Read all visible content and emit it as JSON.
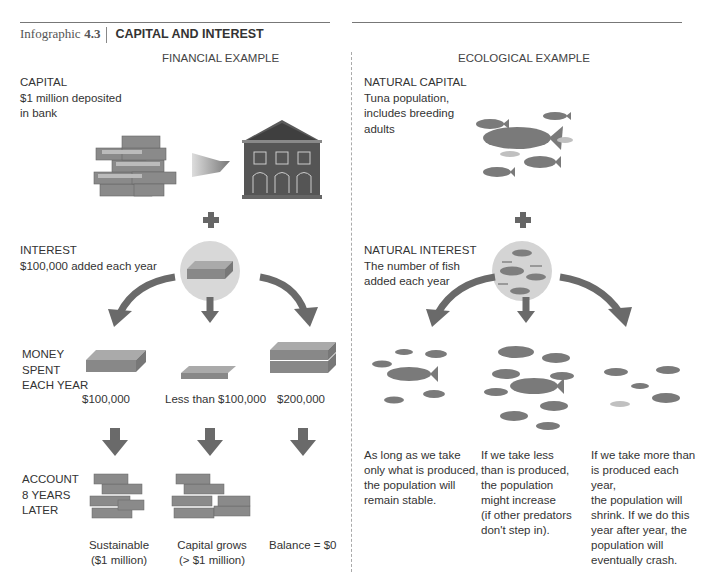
{
  "header": {
    "prefix": "Infographic",
    "number": "4.3",
    "title": "CAPITAL AND INTEREST"
  },
  "financial": {
    "section_title": "FINANCIAL EXAMPLE",
    "capital": {
      "heading": "CAPITAL",
      "line1": "$1 million deposited",
      "line2": "in bank"
    },
    "interest": {
      "heading": "INTEREST",
      "line1": "$100,000 added each year"
    },
    "spent_label": {
      "line1": "MONEY",
      "line2": "SPENT",
      "line3": "EACH YEAR"
    },
    "spent_values": [
      "$100,000",
      "Less than $100,000",
      "$200,000"
    ],
    "account_label": {
      "line1": "ACCOUNT",
      "line2": "8 YEARS",
      "line3": "LATER"
    },
    "outcomes": [
      {
        "line1": "Sustainable",
        "line2": "($1 million)"
      },
      {
        "line1": "Capital grows",
        "line2": "(> $1 million)"
      },
      {
        "line1": "Balance = $0",
        "line2": ""
      }
    ]
  },
  "ecological": {
    "section_title": "ECOLOGICAL EXAMPLE",
    "capital": {
      "heading": "NATURAL CAPITAL",
      "line1": "Tuna population,",
      "line2": "includes breeding",
      "line3": "adults"
    },
    "interest": {
      "heading": "NATURAL INTEREST",
      "line1": "The number of fish",
      "line2": "added each year"
    },
    "outcomes": [
      [
        "As long as we take",
        "only what is produced,",
        "the population will",
        "remain stable."
      ],
      [
        "If we take less",
        "than is produced,",
        "the population",
        "might increase",
        "(if other predators",
        "don't step in)."
      ],
      [
        "If we take more than",
        "is produced each year,",
        "the population will",
        "shrink. If we do this",
        "year after year, the",
        "population will",
        "eventually crash."
      ]
    ]
  },
  "colors": {
    "icon_dark": "#555555",
    "icon_mid": "#8a8a8a",
    "circle_bg": "#d8d8d8",
    "divider": "#aaaaaa"
  }
}
